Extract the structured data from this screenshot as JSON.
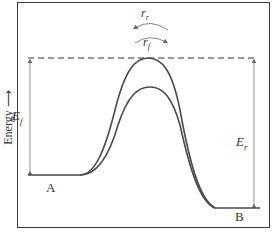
{
  "diagram": {
    "type": "energy-profile",
    "y_axis_label": "Energy ⟶",
    "labels": {
      "E_forward": "E",
      "E_forward_sub": "f",
      "E_reverse": "E",
      "E_reverse_sub": "r",
      "rate_reverse": "r",
      "rate_reverse_sub": "r",
      "rate_forward": "r",
      "rate_forward_sub": "f",
      "state_A": "A",
      "state_B": "B"
    },
    "curves": [
      {
        "name": "uncatalyzed",
        "peak": "higher"
      },
      {
        "name": "catalyzed",
        "peak": "lower"
      }
    ],
    "colors": {
      "curve": "#4a4a4a",
      "arrows": "#666666",
      "frame": "#3a3a3a"
    }
  }
}
